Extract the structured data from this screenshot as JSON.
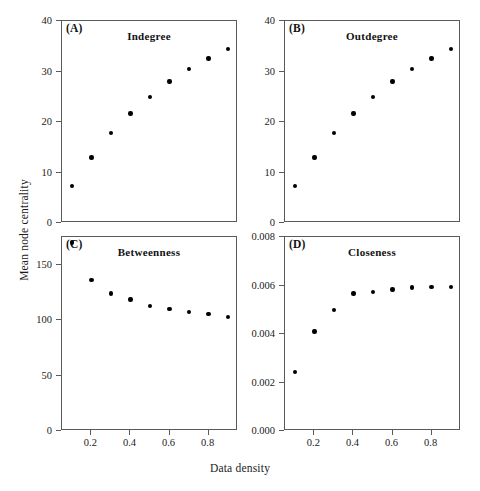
{
  "figure": {
    "xlabel": "Data density",
    "ylabel": "Mean node centrality",
    "background": "#ffffff",
    "point_color": "#000000",
    "axis_color": "#5a5a5a"
  },
  "chart_data": [
    {
      "type": "scatter",
      "panel_label": "(A)",
      "title": "Indegree",
      "xlabel": "Data density",
      "ylabel": "Mean node centrality",
      "x": [
        0.1,
        0.2,
        0.3,
        0.4,
        0.5,
        0.6,
        0.7,
        0.8,
        0.9
      ],
      "values": [
        7.3,
        13.0,
        17.8,
        21.7,
        25.0,
        28.0,
        30.5,
        32.6,
        34.5
      ],
      "xlim": [
        0.05,
        0.95
      ],
      "ylim": [
        0,
        40
      ],
      "xticks": [
        0.2,
        0.4,
        0.6,
        0.8
      ],
      "xticklabels": [
        "0.2",
        "0.4",
        "0.6",
        "0.8"
      ],
      "yticks": [
        0,
        10,
        20,
        30,
        40
      ],
      "yticklabels": [
        "0",
        "10",
        "20",
        "30",
        "40"
      ],
      "grid": false,
      "legend": "none"
    },
    {
      "type": "scatter",
      "panel_label": "(B)",
      "title": "Outdegree",
      "xlabel": "Data density",
      "ylabel": "Mean node centrality",
      "x": [
        0.1,
        0.2,
        0.3,
        0.4,
        0.5,
        0.6,
        0.7,
        0.8,
        0.9
      ],
      "values": [
        7.3,
        13.0,
        17.8,
        21.7,
        25.0,
        28.0,
        30.5,
        32.6,
        34.5
      ],
      "xlim": [
        0.05,
        0.95
      ],
      "ylim": [
        0,
        40
      ],
      "xticks": [
        0.2,
        0.4,
        0.6,
        0.8
      ],
      "xticklabels": [
        "0.2",
        "0.4",
        "0.6",
        "0.8"
      ],
      "yticks": [
        0,
        10,
        20,
        30,
        40
      ],
      "yticklabels": [
        "0",
        "10",
        "20",
        "30",
        "40"
      ],
      "grid": false,
      "legend": "none"
    },
    {
      "type": "scatter",
      "panel_label": "(C)",
      "title": "Betweenness",
      "xlabel": "Data density",
      "ylabel": "Mean node centrality",
      "x": [
        0.1,
        0.2,
        0.3,
        0.4,
        0.5,
        0.6,
        0.7,
        0.8,
        0.9
      ],
      "values": [
        170,
        136,
        124,
        118.5,
        113,
        110,
        107.5,
        105.5,
        103
      ],
      "xlim": [
        0.05,
        0.95
      ],
      "ylim": [
        0,
        175
      ],
      "xticks": [
        0.2,
        0.4,
        0.6,
        0.8
      ],
      "xticklabels": [
        "0.2",
        "0.4",
        "0.6",
        "0.8"
      ],
      "yticks": [
        0,
        50,
        100,
        150
      ],
      "yticklabels": [
        "0",
        "50",
        "100",
        "150"
      ],
      "grid": false,
      "legend": "none"
    },
    {
      "type": "scatter",
      "panel_label": "(D)",
      "title": "Closeness",
      "xlabel": "Data density",
      "ylabel": "Mean node centrality",
      "x": [
        0.1,
        0.2,
        0.3,
        0.4,
        0.5,
        0.6,
        0.7,
        0.8,
        0.9
      ],
      "values": [
        0.00243,
        0.00411,
        0.00499,
        0.00567,
        0.00573,
        0.00584,
        0.00592,
        0.00593,
        0.00595
      ],
      "xlim": [
        0.05,
        0.95
      ],
      "ylim": [
        0.0,
        0.008
      ],
      "xticks": [
        0.2,
        0.4,
        0.6,
        0.8
      ],
      "xticklabels": [
        "0.2",
        "0.4",
        "0.6",
        "0.8"
      ],
      "yticks": [
        0.0,
        0.002,
        0.004,
        0.006,
        0.008
      ],
      "yticklabels": [
        "0.000",
        "0.002",
        "0.004",
        "0.006",
        "0.008"
      ],
      "grid": false,
      "legend": "none"
    }
  ]
}
